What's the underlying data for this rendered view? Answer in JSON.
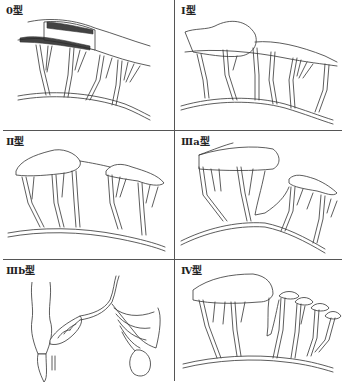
{
  "figure": {
    "panels": [
      {
        "id": "type-0",
        "label": "0型"
      },
      {
        "id": "type-1",
        "label": "Ⅰ型"
      },
      {
        "id": "type-2",
        "label": "Ⅱ型"
      },
      {
        "id": "type-3a",
        "label": "Ⅲa型"
      },
      {
        "id": "type-3b",
        "label": "Ⅲb型"
      },
      {
        "id": "type-4",
        "label": "Ⅳ型"
      }
    ]
  },
  "colors": {
    "line": "#333333",
    "divider": "#555555",
    "shading": "#2a2a2a",
    "background": "#ffffff"
  }
}
